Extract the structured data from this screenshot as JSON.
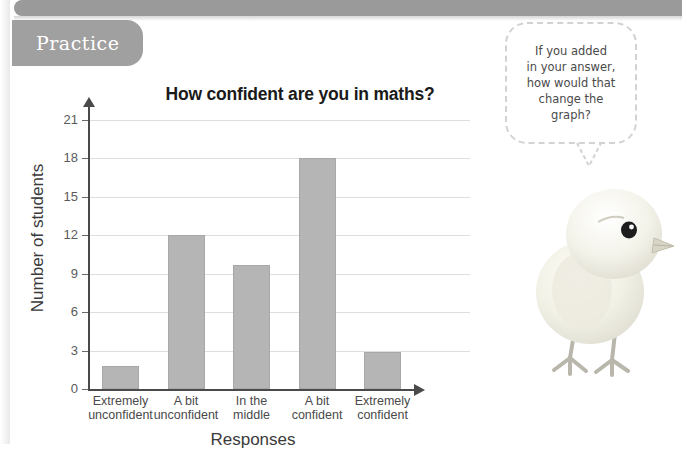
{
  "page": {
    "section_label": "Practice",
    "background_color": "#ffffff",
    "bar_color": "#b5b5b5",
    "axis_color": "#4a4a4a",
    "grid_color": "#dedede",
    "tab_color": "#a0a0a0",
    "top_bar_color": "#9a9a9a"
  },
  "speech_bubble": {
    "text": "If you added in your answer, how would that change the graph?",
    "lines": [
      "If you added",
      "in your answer,",
      "how would that",
      "change the",
      "graph?"
    ]
  },
  "illustration": {
    "name": "chick-photo",
    "description": "pale yellow baby chick standing, facing right"
  },
  "chart_data": {
    "type": "bar",
    "title": "How confident are you in maths?",
    "xlabel": "Responses",
    "ylabel": "Number of students",
    "categories": [
      "Extremely unconfident",
      "A bit unconfident",
      "In the middle",
      "A bit confident",
      "Extremely confident"
    ],
    "category_lines": [
      [
        "Extremely",
        "unconfident"
      ],
      [
        "A bit",
        "unconfident"
      ],
      [
        "In the",
        "middle"
      ],
      [
        "A bit",
        "confident"
      ],
      [
        "Extremely",
        "confident"
      ]
    ],
    "values": [
      1.8,
      12,
      9.7,
      18,
      2.9
    ],
    "ylim": [
      0,
      21
    ],
    "yticks": [
      0,
      3,
      6,
      9,
      12,
      15,
      18,
      21
    ],
    "grid": true,
    "legend": false
  }
}
